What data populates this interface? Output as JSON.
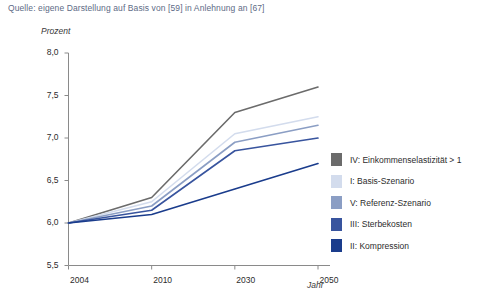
{
  "source_note": "Quelle: eigene Darstellung auf Basis von [59] in Anlehnung an [67]",
  "chart_data": {
    "type": "line",
    "title": "",
    "xlabel": "Jahr",
    "ylabel": "Prozent",
    "x": [
      2004,
      2010,
      2030,
      2050
    ],
    "xtick_labels": [
      "2004",
      "2010",
      "2030",
      "2050"
    ],
    "ytick_labels": [
      "5,5",
      "6,0",
      "6,5",
      "7,0",
      "7,5",
      "8,0"
    ],
    "ytick_values": [
      5.5,
      6.0,
      6.5,
      7.0,
      7.5,
      8.0
    ],
    "ylim": [
      5.5,
      8.0
    ],
    "xlim": [
      2004,
      2050
    ],
    "grid": false,
    "legend_position": "right",
    "series": [
      {
        "name": "IV: Einkommenselastizität > 1",
        "color": "#6b6b6b",
        "values": [
          6.0,
          6.3,
          7.3,
          7.6
        ]
      },
      {
        "name": "I: Basis-Szenario",
        "color": "#d3dced",
        "values": [
          6.0,
          6.25,
          7.05,
          7.25
        ]
      },
      {
        "name": "V: Referenz-Szenario",
        "color": "#8b9ec4",
        "values": [
          6.0,
          6.2,
          6.95,
          7.15
        ]
      },
      {
        "name": "III: Sterbekosten",
        "color": "#38549e",
        "values": [
          6.0,
          6.15,
          6.85,
          7.0
        ]
      },
      {
        "name": "II: Kompression",
        "color": "#1a3c8c",
        "values": [
          6.0,
          6.1,
          6.4,
          6.7
        ]
      }
    ]
  },
  "colors": {
    "axis": "#8a8a8a",
    "text": "#2c2c2c",
    "source_text": "#5d6b86"
  }
}
